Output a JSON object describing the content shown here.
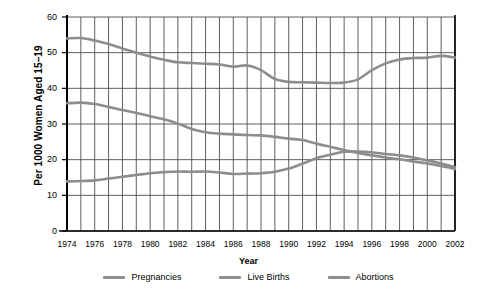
{
  "chart_data": {
    "type": "line",
    "title": "",
    "xlabel": "Year",
    "ylabel": "Per 1000 Women Aged 15–19",
    "xlim": [
      1974,
      2002
    ],
    "ylim": [
      0,
      60
    ],
    "ytick_step": 10,
    "xtick_step": 2,
    "grid": "both",
    "legend_position": "bottom",
    "x": [
      1974,
      1975,
      1976,
      1977,
      1978,
      1979,
      1980,
      1981,
      1982,
      1983,
      1984,
      1985,
      1986,
      1987,
      1988,
      1989,
      1990,
      1991,
      1992,
      1993,
      1994,
      1995,
      1996,
      1997,
      1998,
      1999,
      2000,
      2001,
      2002
    ],
    "xtick_labels": [
      "1974",
      "1976",
      "1978",
      "1980",
      "1982",
      "1984",
      "1986",
      "1988",
      "1990",
      "1992",
      "1994",
      "1996",
      "1998",
      "2000",
      "2002"
    ],
    "ytick_labels": [
      "0",
      "10",
      "20",
      "30",
      "40",
      "50",
      "60"
    ],
    "series": [
      {
        "name": "Pregnancies",
        "color": "#8d8d8d",
        "values": [
          54.0,
          54.1,
          53.4,
          52.4,
          51.2,
          50.0,
          48.9,
          48.0,
          47.3,
          47.1,
          46.9,
          46.7,
          46.1,
          46.4,
          45.1,
          42.6,
          41.8,
          41.7,
          41.6,
          41.5,
          41.6,
          42.5,
          45.1,
          47.0,
          48.1,
          48.5,
          48.6,
          49.1,
          48.6
        ],
        "values_note": "left-to-right reading of the upper curve"
      },
      {
        "name": "Live Births",
        "color": "#8d8d8d",
        "values": [
          35.8,
          36.0,
          35.6,
          34.8,
          33.9,
          33.1,
          32.2,
          31.3,
          30.1,
          28.6,
          27.7,
          27.3,
          27.1,
          26.9,
          26.8,
          26.4,
          25.9,
          25.5,
          24.5,
          23.6,
          22.7,
          21.9,
          21.2,
          20.6,
          20.1,
          19.5,
          18.9,
          18.2,
          17.4
        ],
        "values_note": "left-to-right reading of the middle curve"
      },
      {
        "name": "Abortions",
        "color": "#8d8d8d",
        "values": [
          13.9,
          14.0,
          14.2,
          14.7,
          15.2,
          15.7,
          16.2,
          16.5,
          16.7,
          16.6,
          16.7,
          16.4,
          16.0,
          16.1,
          16.2,
          16.6,
          17.5,
          18.9,
          20.4,
          21.4,
          22.2,
          22.3,
          22.1,
          21.6,
          21.2,
          20.6,
          19.8,
          18.9,
          17.9
        ],
        "values_note": "left-to-right reading of the lower curve"
      }
    ]
  },
  "legend": {
    "items": [
      {
        "label": "Pregnancies"
      },
      {
        "label": "Live Births"
      },
      {
        "label": "Abortions"
      }
    ]
  },
  "axes": {
    "x_title": "Year",
    "y_title": "Per 1000 Women Aged 15–19"
  },
  "colors": {
    "line": "#8d8d8d",
    "grid": "#4d4d4d",
    "axis": "#000000",
    "background": "#ffffff"
  }
}
